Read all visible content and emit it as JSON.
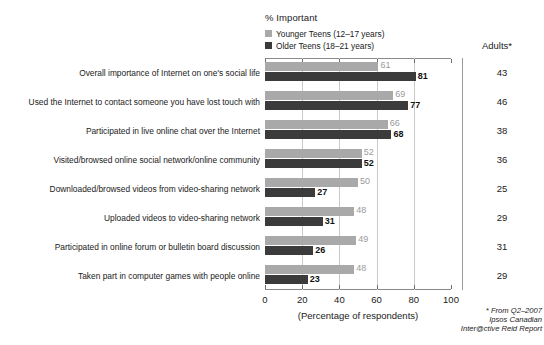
{
  "chart_data": {
    "type": "bar",
    "title": "% Important",
    "orientation": "horizontal",
    "xlabel": "(Percentage of respondents)",
    "ylabel": "",
    "xlim": [
      0,
      100
    ],
    "xticks": [
      0,
      20,
      40,
      60,
      80,
      100
    ],
    "grid": true,
    "legend_position": "top-left",
    "categories": [
      "Overall importance of Internet on one's social life",
      "Used the Internet to contact someone you have lost touch with",
      "Participated in live online chat over the Internet",
      "Visited/browsed online social network/online community",
      "Downloaded/browsed videos from video-sharing network",
      "Uploaded videos to video-sharing network",
      "Participated in online forum or bulletin board discussion",
      "Taken part in computer games with people online"
    ],
    "series": [
      {
        "name": "Younger Teens (12–17 years)",
        "color": "#a9a9a9",
        "values": [
          61,
          69,
          66,
          52,
          50,
          48,
          49,
          48
        ]
      },
      {
        "name": "Older Teens (18–21 years)",
        "color": "#3b3b3b",
        "values": [
          81,
          77,
          68,
          52,
          27,
          31,
          26,
          23
        ]
      }
    ],
    "side_column": {
      "header": "Adults*",
      "values": [
        43,
        46,
        38,
        36,
        25,
        29,
        31,
        29
      ]
    },
    "annotations": [
      "* From Q2–2007",
      "Ipsos Canadian",
      "Inter@ctive Reid Report"
    ]
  },
  "legend": {
    "title": "% Important",
    "items": [
      {
        "label": "Younger Teens (12–17 years)",
        "color": "#a9a9a9"
      },
      {
        "label": "Older Teens (18–21 years)",
        "color": "#3b3b3b"
      }
    ]
  },
  "axis": {
    "x_title": "(Percentage of respondents)",
    "ticks": [
      "0",
      "20",
      "40",
      "60",
      "80",
      "100"
    ]
  },
  "adults": {
    "header": "Adults*",
    "values": [
      "43",
      "46",
      "38",
      "36",
      "25",
      "29",
      "31",
      "29"
    ]
  },
  "footnote": {
    "line1": "* From Q2–2007",
    "line2": "Ipsos Canadian",
    "line3": "Inter@ctive Reid Report"
  },
  "colors": {
    "younger": "#a9a9a9",
    "older": "#3b3b3b",
    "grid": "#c9c9c9",
    "axis": "#8a8a8a",
    "background": "#ffffff"
  }
}
